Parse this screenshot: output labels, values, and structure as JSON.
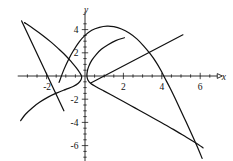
{
  "chart_data": {
    "type": "line",
    "title": "",
    "xlabel": "x",
    "ylabel": "y",
    "grid": false,
    "legend": "none",
    "xlim": [
      -3.4,
      7.2
    ],
    "ylim": [
      -7.6,
      5.2
    ],
    "x_ticks": [
      -2,
      2,
      4,
      6
    ],
    "x_tick_labels": [
      "-2",
      "2",
      "4",
      "6"
    ],
    "y_ticks": [
      4,
      2,
      -2,
      -4,
      -6
    ],
    "y_tick_labels": [
      "4",
      "2",
      "-2",
      "-4",
      "-6"
    ],
    "x_minor_tick_step": 0.5,
    "y_minor_tick_step": 0.5,
    "series": [
      {
        "name": "downward-parabola",
        "type": "curve",
        "points": [
          [
            -1.35,
            -0.55
          ],
          [
            -1.1,
            0.55
          ],
          [
            -0.85,
            1.45
          ],
          [
            -0.6,
            2.2
          ],
          [
            -0.3,
            2.95
          ],
          [
            0.0,
            3.5
          ],
          [
            0.35,
            3.95
          ],
          [
            0.75,
            4.2
          ],
          [
            1.15,
            4.3
          ],
          [
            1.5,
            4.25
          ],
          [
            1.9,
            4.05
          ],
          [
            2.3,
            3.7
          ],
          [
            2.7,
            3.2
          ],
          [
            3.05,
            2.6
          ],
          [
            3.4,
            1.9
          ],
          [
            3.7,
            1.2
          ],
          [
            3.95,
            0.5
          ],
          [
            4.15,
            -0.15
          ],
          [
            4.45,
            -1.1
          ],
          [
            4.8,
            -2.3
          ],
          [
            5.15,
            -3.55
          ],
          [
            5.5,
            -4.8
          ],
          [
            5.85,
            -6.1
          ],
          [
            6.1,
            -7.1
          ]
        ]
      },
      {
        "name": "left-opening-sideways-parabola",
        "type": "curve",
        "points": [
          [
            -3.15,
            4.6
          ],
          [
            -2.7,
            4.1
          ],
          [
            -2.2,
            3.5
          ],
          [
            -1.75,
            2.9
          ],
          [
            -1.35,
            2.3
          ],
          [
            -1.0,
            1.75
          ],
          [
            -0.7,
            1.2
          ],
          [
            -0.45,
            0.7
          ],
          [
            -0.28,
            0.3
          ],
          [
            -0.18,
            0.0
          ],
          [
            -0.2,
            -0.3
          ],
          [
            -0.35,
            -0.62
          ],
          [
            -0.62,
            -0.9
          ],
          [
            -1.0,
            -1.15
          ],
          [
            -1.45,
            -1.45
          ],
          [
            -1.9,
            -1.8
          ],
          [
            -2.35,
            -2.25
          ],
          [
            -2.75,
            -2.75
          ],
          [
            -3.1,
            -3.3
          ],
          [
            -3.35,
            -3.85
          ]
        ]
      },
      {
        "name": "right-opening-sideways-parabola",
        "type": "curve",
        "points": [
          [
            2.05,
            3.3
          ],
          [
            1.6,
            3.05
          ],
          [
            1.2,
            2.7
          ],
          [
            0.85,
            2.3
          ],
          [
            0.58,
            1.85
          ],
          [
            0.35,
            1.35
          ],
          [
            0.2,
            0.85
          ],
          [
            0.12,
            0.4
          ],
          [
            0.1,
            0.0
          ],
          [
            0.15,
            -0.35
          ],
          [
            0.3,
            -0.65
          ],
          [
            0.6,
            -0.95
          ],
          [
            1.0,
            -1.3
          ],
          [
            1.5,
            -1.75
          ],
          [
            2.0,
            -2.2
          ],
          [
            2.6,
            -2.75
          ],
          [
            3.2,
            -3.3
          ],
          [
            3.9,
            -3.95
          ],
          [
            4.6,
            -4.6
          ],
          [
            5.3,
            -5.3
          ],
          [
            5.9,
            -5.9
          ],
          [
            6.15,
            -6.2
          ]
        ]
      },
      {
        "name": "ascending-line",
        "type": "line",
        "points": [
          [
            0.3,
            -0.6
          ],
          [
            5.1,
            3.55
          ]
        ]
      },
      {
        "name": "descending-line",
        "type": "line",
        "points": [
          [
            -3.3,
            4.75
          ],
          [
            -1.1,
            -3.0
          ]
        ]
      }
    ]
  },
  "labels": {
    "x_axis": "x",
    "y_axis": "y",
    "x_neg_two": "-2",
    "x_two": "2",
    "x_four": "4",
    "x_six": "6",
    "y_four": "4",
    "y_two": "2",
    "y_neg_two": "-2",
    "y_neg_four": "-4",
    "y_neg_six": "-6"
  },
  "colors": {
    "curve": "#111111",
    "axis": "#1a1a1a",
    "background": "#ffffff"
  }
}
